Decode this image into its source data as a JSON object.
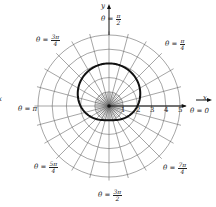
{
  "figure": {
    "type": "polar-graph",
    "curve_description": "limacon r = 2 + sin(theta)",
    "axis_labels": {
      "x": "x",
      "y": "y",
      "x_left_clipped": "x"
    },
    "radial_tick_labels": [
      "1",
      "2",
      "3",
      "4",
      "5"
    ],
    "angle_labels": [
      {
        "theta_prefix": "θ = ",
        "num": "π",
        "den": "2",
        "angle": "pi/2"
      },
      {
        "theta_prefix": "θ = ",
        "num": "π",
        "den": "4",
        "angle": "pi/4"
      },
      {
        "theta_prefix": "θ = ",
        "num": "3π",
        "den": "4",
        "angle": "3pi/4"
      },
      {
        "theta_prefix": "θ = π",
        "num": "",
        "den": "",
        "angle": "pi"
      },
      {
        "theta_prefix": "θ = 0",
        "num": "",
        "den": "",
        "angle": "0"
      },
      {
        "theta_prefix": "θ = ",
        "num": "5π",
        "den": "4",
        "angle": "5pi/4"
      },
      {
        "theta_prefix": "θ = ",
        "num": "7π",
        "den": "4",
        "angle": "7pi/4"
      },
      {
        "theta_prefix": "θ = ",
        "num": "3π",
        "den": "2",
        "angle": "3pi/2"
      }
    ],
    "grid": {
      "rings": [
        1,
        2,
        3,
        4,
        5
      ],
      "spokes_every_deg": 15
    },
    "colors": {
      "grid": "#6a6a6a",
      "curve": "#111111",
      "axis": "#111111"
    }
  },
  "chart_data": {
    "type": "line",
    "coordinate_system": "polar",
    "title": "",
    "series": [
      {
        "name": "r = 2 + sin θ",
        "equation": "r = 2 + sin(theta)",
        "theta": [
          "0",
          "π/2",
          "π",
          "3π/2"
        ],
        "r": [
          2,
          3,
          2,
          1
        ]
      }
    ],
    "r_range": [
      0,
      5
    ],
    "r_ticks": [
      1,
      2,
      3,
      4,
      5
    ],
    "theta_labels": [
      "0",
      "π/4",
      "π/2",
      "3π/4",
      "π",
      "5π/4",
      "3π/2",
      "7π/4"
    ],
    "grid": true
  }
}
